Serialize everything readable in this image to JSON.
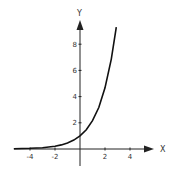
{
  "chart_data": {
    "type": "line",
    "title": "",
    "xlabel": "X",
    "ylabel": "Y",
    "xlim": [
      -5.3,
      5.8
    ],
    "ylim": [
      -1.3,
      10.2
    ],
    "grid": false,
    "legend": null,
    "x_ticks": [
      -4,
      -2,
      2,
      4
    ],
    "x_tick_labels": [
      "-4",
      "-2",
      "2",
      "4"
    ],
    "y_ticks": [
      2,
      4,
      6,
      8
    ],
    "y_tick_labels": [
      "2",
      "4",
      "6",
      "8"
    ],
    "series": [
      {
        "name": "exponential curve",
        "x": [
          -5.3,
          -4,
          -3,
          -2,
          -1.5,
          -1,
          -0.5,
          0,
          0.5,
          1,
          1.5,
          2,
          2.5,
          2.9
        ],
        "y": [
          0.02,
          0.05,
          0.1,
          0.21,
          0.31,
          0.46,
          0.68,
          1.0,
          1.47,
          2.16,
          3.17,
          4.67,
          6.86,
          9.3
        ]
      }
    ]
  },
  "axes": {
    "x_label": "X",
    "y_label": "Y"
  }
}
